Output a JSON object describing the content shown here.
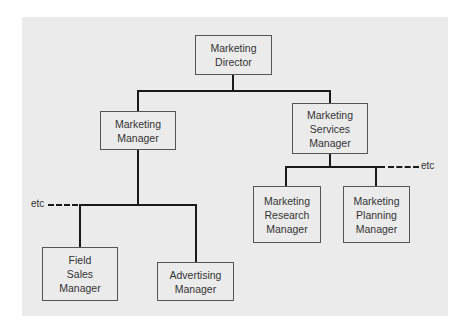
{
  "diagram": {
    "type": "org-chart",
    "nodes": [
      {
        "id": "director",
        "lines": [
          "Marketing",
          "Director"
        ]
      },
      {
        "id": "marketing_manager",
        "lines": [
          "Marketing",
          "Manager"
        ]
      },
      {
        "id": "services_manager",
        "lines": [
          "Marketing",
          "Services",
          "Manager"
        ]
      },
      {
        "id": "field_sales_manager",
        "lines": [
          "Field",
          "Sales",
          "Manager"
        ]
      },
      {
        "id": "advertising_manager",
        "lines": [
          "Advertising",
          "Manager"
        ]
      },
      {
        "id": "research_manager",
        "lines": [
          "Marketing",
          "Research",
          "Manager"
        ]
      },
      {
        "id": "planning_manager",
        "lines": [
          "Marketing",
          "Planning",
          "Manager"
        ]
      }
    ],
    "edges": [
      [
        "director",
        "marketing_manager"
      ],
      [
        "director",
        "services_manager"
      ],
      [
        "marketing_manager",
        "field_sales_manager"
      ],
      [
        "marketing_manager",
        "advertising_manager"
      ],
      [
        "services_manager",
        "research_manager"
      ],
      [
        "services_manager",
        "planning_manager"
      ]
    ],
    "continuation_labels": {
      "left": "etc",
      "right": "etc"
    }
  }
}
